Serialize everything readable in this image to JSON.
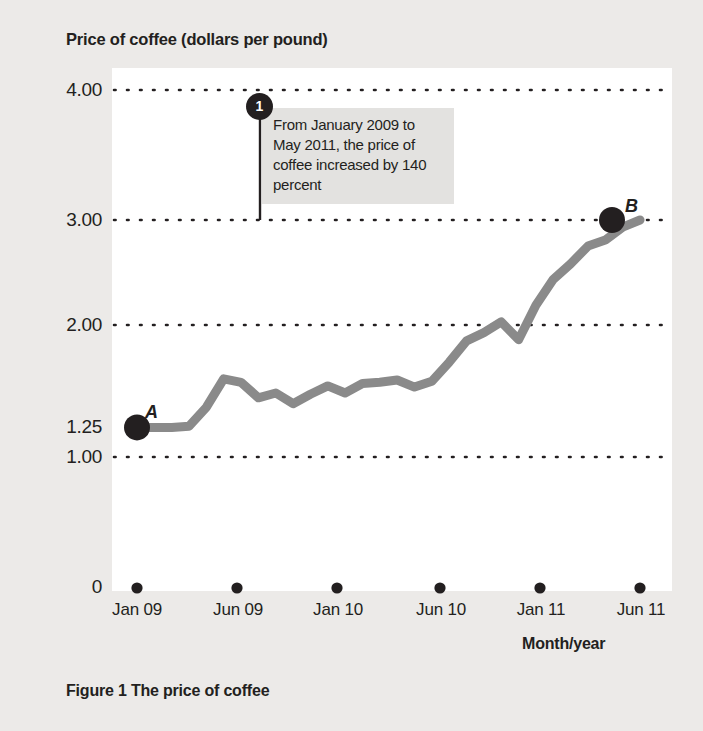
{
  "figure": {
    "caption": "Figure 1  The price of coffee",
    "chart_title": "Price of coffee (dollars per pound)",
    "xaxis_label": "Month/year"
  },
  "annotation": {
    "badge": "1",
    "text": "From January 2009 to May 2011, the price of coffee increased by 140 percent"
  },
  "points": {
    "a_label": "A",
    "b_label": "B"
  },
  "colors": {
    "page_background": "#eceae8",
    "plot_background": "#ffffff",
    "line": "#8a8a8a",
    "marker": "#231f20",
    "gridline": "#231f20",
    "annotation_background": "#e3e2e0",
    "text": "#231f20"
  },
  "chart_data": {
    "type": "line",
    "title": "Price of coffee (dollars per pound)",
    "xlabel": "Month/year",
    "ylabel": "Price of coffee (dollars per pound)",
    "ylim": [
      0,
      4.35
    ],
    "xlim": [
      0,
      30
    ],
    "grid": true,
    "gridlines": [
      1.0,
      2.0,
      3.0,
      4.0
    ],
    "ytick_labels": [
      "4.00",
      "3.00",
      "2.00",
      "1.25",
      "1.00",
      "0"
    ],
    "ytick_values": [
      4.0,
      3.0,
      2.0,
      1.25,
      1.0,
      0
    ],
    "xtick_labels": [
      "Jan 09",
      "Jun 09",
      "Jan 10",
      "Jun 10",
      "Jan 11",
      "Jun 11"
    ],
    "xtick_values": [
      0,
      5,
      12,
      17,
      24,
      29
    ],
    "legend": null,
    "series": [
      {
        "name": "Price of coffee",
        "x": [
          0,
          1,
          2,
          3,
          4,
          5,
          6,
          7,
          8,
          9,
          10,
          11,
          12,
          13,
          14,
          15,
          16,
          17,
          18,
          19,
          20,
          21,
          22,
          23,
          24,
          25,
          26,
          27,
          28,
          29
        ],
        "values": [
          1.25,
          1.25,
          1.25,
          1.26,
          1.42,
          1.66,
          1.63,
          1.5,
          1.54,
          1.45,
          1.53,
          1.6,
          1.54,
          1.62,
          1.63,
          1.65,
          1.59,
          1.64,
          1.8,
          1.98,
          2.05,
          2.14,
          1.99,
          2.28,
          2.5,
          2.63,
          2.78,
          2.83,
          2.94,
          3.0
        ]
      }
    ],
    "markers": [
      {
        "label": "A",
        "x": 0,
        "y": 1.25,
        "xlabel": "Jan 09"
      },
      {
        "label": "B",
        "x": 29,
        "y": 3.0,
        "xlabel": "Jun 11"
      }
    ],
    "annotations": [
      {
        "id": "1",
        "text": "From January 2009 to May 2011, the price of coffee increased by 140 percent",
        "anchor_y": 3.0
      }
    ]
  }
}
